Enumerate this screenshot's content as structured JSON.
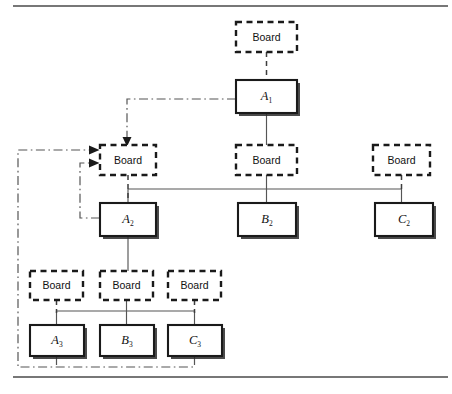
{
  "figure": {
    "background_color": "#ffffff",
    "frame": {
      "top_rule": {
        "x1": 13,
        "y1": 6,
        "x2": 448,
        "y2": 6
      },
      "bottom_rule": {
        "x1": 13,
        "y1": 377,
        "x2": 448,
        "y2": 377
      },
      "color": "#4a4a4a"
    },
    "colors": {
      "solid_box_stroke": "#1a1a1a",
      "dashed_box_stroke": "#1a1a1a",
      "solid_connector": "#555555",
      "dashdot_connector": "#555555",
      "text": "#111111"
    }
  },
  "nodes": {
    "boards": [
      {
        "id": "board-a1",
        "label": "Board",
        "x": 236,
        "y": 22,
        "w": 61,
        "h": 30,
        "level": 1
      },
      {
        "id": "board-a2",
        "label": "Board",
        "x": 100,
        "y": 145,
        "w": 56,
        "h": 30,
        "level": 2
      },
      {
        "id": "board-b2",
        "label": "Board",
        "x": 236,
        "y": 145,
        "w": 61,
        "h": 30,
        "level": 2
      },
      {
        "id": "board-c2",
        "label": "Board",
        "x": 373,
        "y": 145,
        "w": 57,
        "h": 30,
        "level": 2
      },
      {
        "id": "board-a3",
        "label": "Board",
        "x": 28,
        "y": 271,
        "w": 53,
        "h": 29,
        "level": 3
      },
      {
        "id": "board-b3",
        "label": "Board",
        "x": 100,
        "y": 271,
        "w": 53,
        "h": 29,
        "level": 3
      },
      {
        "id": "board-c3",
        "label": "Board",
        "x": 168,
        "y": 271,
        "w": 53,
        "h": 29,
        "level": 3
      }
    ],
    "units": [
      {
        "id": "unit-a1",
        "letter": "A",
        "subscript": "1",
        "x": 236,
        "y": 80,
        "w": 61,
        "h": 33,
        "level": 1
      },
      {
        "id": "unit-a2",
        "letter": "A",
        "subscript": "2",
        "x": 100,
        "y": 203,
        "w": 56,
        "h": 33,
        "level": 2
      },
      {
        "id": "unit-b2",
        "letter": "B",
        "subscript": "2",
        "x": 238,
        "y": 203,
        "w": 58,
        "h": 33,
        "level": 2
      },
      {
        "id": "unit-c2",
        "letter": "C",
        "subscript": "2",
        "x": 375,
        "y": 203,
        "w": 58,
        "h": 33,
        "level": 2
      },
      {
        "id": "unit-a3",
        "letter": "A",
        "subscript": "3",
        "x": 30,
        "y": 325,
        "w": 54,
        "h": 31,
        "level": 3
      },
      {
        "id": "unit-b3",
        "letter": "B",
        "subscript": "3",
        "x": 100,
        "y": 325,
        "w": 54,
        "h": 31,
        "level": 3
      },
      {
        "id": "unit-c3",
        "letter": "C",
        "subscript": "3",
        "x": 168,
        "y": 325,
        "w": 54,
        "h": 31,
        "level": 3
      }
    ]
  },
  "edges": {
    "dashed_vertical": [
      {
        "id": "edge-board-a1-to-unit-a1",
        "from": "board-a1",
        "to": "unit-a1",
        "d": "M 266.5 52 L 266.5 80"
      },
      {
        "id": "edge-board-a2-to-unit-a2",
        "from": "board-a2",
        "to": "unit-a2",
        "d": "M 128 175 L 128 203"
      },
      {
        "id": "edge-board-b2-to-hbar",
        "from": "board-b2",
        "to": "unit-b2",
        "d": "M 266.5 175 L 266.5 189"
      },
      {
        "id": "edge-board-c2-to-hbar",
        "from": "board-c2",
        "to": "unit-c2",
        "d": "M 401.5 175 L 401.5 189"
      },
      {
        "id": "edge-board-a3-to-hbar",
        "from": "board-a3",
        "to": "unit-a3",
        "d": "M 56.5 300 L 56.5 311"
      },
      {
        "id": "edge-board-b3-to-hbar",
        "from": "board-b3",
        "to": "unit-b3",
        "d": "M 126.5 300 L 126.5 311"
      },
      {
        "id": "edge-board-c3-to-hbar",
        "from": "board-c3",
        "to": "unit-c3",
        "d": "M 194.5 300 L 194.5 311"
      }
    ],
    "solid_tree": [
      {
        "id": "edge-unit-a1-down",
        "d": "M 266.5 113 L 266.5 145"
      },
      {
        "id": "edge-unit-a2-down",
        "d": "M 128 236 L 128 271"
      },
      {
        "id": "edge-level2-hbar",
        "d": "M 128 189 L 401.5 189"
      },
      {
        "id": "edge-hbar-to-a2",
        "d": "M 128 189 L 128 203"
      },
      {
        "id": "edge-hbar-to-b2",
        "d": "M 266.5 189 L 266.5 203"
      },
      {
        "id": "edge-hbar-to-c2",
        "d": "M 401.5 189 L 401.5 203"
      },
      {
        "id": "edge-level3-hbar",
        "d": "M 56.5 311 L 194.5 311"
      },
      {
        "id": "edge-hbar-to-a3",
        "d": "M 56.5 311 L 56.5 325"
      },
      {
        "id": "edge-hbar-to-b3",
        "d": "M 126.5 311 L 126.5 325"
      },
      {
        "id": "edge-hbar-to-c3",
        "d": "M 194.5 311 L 194.5 325"
      }
    ],
    "feedback_dashdot": [
      {
        "id": "feedback-a1-to-board-a2",
        "label": "A1 feedback into level-2 board",
        "d": "M 236 99 L 127 99 L 127 140",
        "arrow_at": {
          "x": 127,
          "y": 145,
          "dir": "down"
        }
      },
      {
        "id": "feedback-a2-to-board-a2",
        "label": "A2 feedback into level-2 board",
        "d": "M 100 218 L 80 218 L 80 162 L 95 162",
        "arrow_at": {
          "x": 100,
          "y": 162,
          "dir": "right"
        }
      },
      {
        "id": "feedback-level3-to-board-a2",
        "label": "Level-3 feedback loop returning to level-2 board",
        "d": "M 194.5 356 L 194.5 367 L 18 367 L 18 150 L 95 150",
        "arrow_at": {
          "x": 100,
          "y": 150,
          "dir": "right"
        }
      },
      {
        "id": "feedback-a3-branch",
        "label": "A3 branch into bottom return line",
        "d": "M 56.5 356 L 56.5 367"
      }
    ]
  }
}
